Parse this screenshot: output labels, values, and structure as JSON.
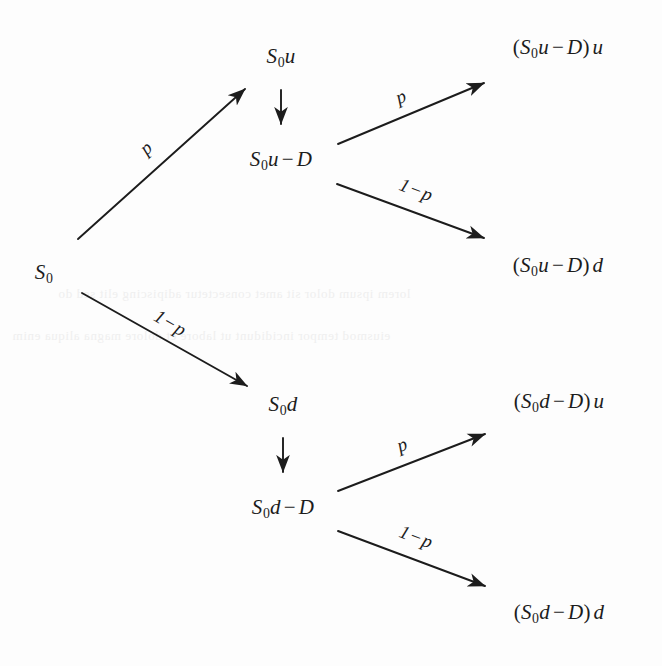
{
  "diagram": {
    "background_color": "#fdfdfd",
    "ink_color": "#1c1c1c",
    "nodes": [
      {
        "id": "root",
        "label": "S0",
        "parts": {
          "sym": "S",
          "sub": "0",
          "tail": ""
        },
        "x": 44,
        "y": 273
      },
      {
        "id": "up",
        "label": "S0u",
        "parts": {
          "sym": "S",
          "sub": "0",
          "tail": "u"
        },
        "x": 281,
        "y": 57
      },
      {
        "id": "up_ex",
        "label": "S0u - D",
        "parts": {
          "sym": "S",
          "sub": "0",
          "tail": "u",
          "op": "−",
          "rhs": "D"
        },
        "x": 281,
        "y": 160
      },
      {
        "id": "up_up",
        "label": "(S0u - D) u",
        "parts": {
          "sym": "S",
          "sub": "0",
          "tail": "u",
          "op": "−",
          "rhs": "D",
          "suffix": "u"
        },
        "x": 558,
        "y": 48
      },
      {
        "id": "up_dn",
        "label": "(S0u - D) d",
        "parts": {
          "sym": "S",
          "sub": "0",
          "tail": "u",
          "op": "−",
          "rhs": "D",
          "suffix": "d"
        },
        "x": 558,
        "y": 266
      },
      {
        "id": "down",
        "label": "S0d",
        "parts": {
          "sym": "S",
          "sub": "0",
          "tail": "d"
        },
        "x": 283,
        "y": 405
      },
      {
        "id": "down_ex",
        "label": "S0d - D",
        "parts": {
          "sym": "S",
          "sub": "0",
          "tail": "d",
          "op": "−",
          "rhs": "D"
        },
        "x": 283,
        "y": 508
      },
      {
        "id": "down_up",
        "label": "(S0d - D) u",
        "parts": {
          "sym": "S",
          "sub": "0",
          "tail": "d",
          "op": "−",
          "rhs": "D",
          "suffix": "u"
        },
        "x": 559,
        "y": 402
      },
      {
        "id": "down_dn",
        "label": "(S0d - D) d",
        "parts": {
          "sym": "S",
          "sub": "0",
          "tail": "d",
          "op": "−",
          "rhs": "D",
          "suffix": "d"
        },
        "x": 559,
        "y": 613
      }
    ],
    "edges": [
      {
        "id": "root-up",
        "from": "root",
        "to": "up",
        "x1": 78,
        "y1": 239,
        "x2": 245,
        "y2": 89,
        "label": "p",
        "style": "arrow"
      },
      {
        "id": "root-down",
        "from": "root",
        "to": "down",
        "x1": 82,
        "y1": 293,
        "x2": 247,
        "y2": 386,
        "label": "1 - p",
        "style": "arrow"
      },
      {
        "id": "up-upex",
        "from": "up",
        "to": "up_ex",
        "x1": 281,
        "y1": 90,
        "x2": 281,
        "y2": 124,
        "label": "",
        "style": "arrow"
      },
      {
        "id": "upex-upup",
        "from": "up_ex",
        "to": "up_up",
        "x1": 338,
        "y1": 144,
        "x2": 484,
        "y2": 83,
        "label": "p",
        "style": "arrow"
      },
      {
        "id": "upex-updn",
        "from": "up_ex",
        "to": "up_dn",
        "x1": 337,
        "y1": 184,
        "x2": 484,
        "y2": 238,
        "label": "1 - p",
        "style": "arrow"
      },
      {
        "id": "down-downex",
        "from": "down",
        "to": "down_ex",
        "x1": 283,
        "y1": 438,
        "x2": 283,
        "y2": 472,
        "label": "",
        "style": "arrow"
      },
      {
        "id": "downex-downup",
        "from": "down_ex",
        "to": "down_up",
        "x1": 338,
        "y1": 491,
        "x2": 485,
        "y2": 434,
        "label": "p",
        "style": "arrow"
      },
      {
        "id": "downex-downdn",
        "from": "down_ex",
        "to": "down_dn",
        "x1": 338,
        "y1": 531,
        "x2": 485,
        "y2": 586,
        "label": "1 - p",
        "style": "arrow"
      }
    ],
    "edge_labels": [
      {
        "id": "lbl-root-up",
        "num": "",
        "op": "",
        "sym": "p",
        "x": 146,
        "y": 148,
        "rotate": -42
      },
      {
        "id": "lbl-root-down",
        "num": "1",
        "op": "−",
        "sym": "p",
        "x": 170,
        "y": 323,
        "rotate": 30
      },
      {
        "id": "lbl-upex-upup",
        "num": "",
        "op": "",
        "sym": "p",
        "x": 401,
        "y": 97,
        "rotate": -22
      },
      {
        "id": "lbl-upex-updn",
        "num": "1",
        "op": "−",
        "sym": "p",
        "x": 416,
        "y": 190,
        "rotate": 21
      },
      {
        "id": "lbl-downex-downup",
        "num": "",
        "op": "",
        "sym": "p",
        "x": 402,
        "y": 445,
        "rotate": -21
      },
      {
        "id": "lbl-downex-downdn",
        "num": "1",
        "op": "−",
        "sym": "p",
        "x": 416,
        "y": 537,
        "rotate": 21
      }
    ]
  }
}
